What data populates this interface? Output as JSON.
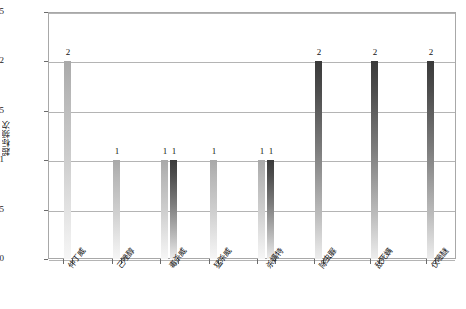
{
  "chart_data": {
    "type": "bar",
    "title": "",
    "xlabel": "",
    "ylabel": "超标频次",
    "ylim": [
      0,
      2.5
    ],
    "ytick_labels": [
      "0",
      "0.5",
      "1",
      "1.5",
      "2",
      "2.5"
    ],
    "ytick_values": [
      0,
      0.5,
      1,
      1.5,
      2,
      2.5
    ],
    "grid": true,
    "legend": "none",
    "categories": [
      "仲丁威",
      "己唑醇",
      "毒杀威",
      "猛杀威",
      "杀螨特",
      "除虫脲",
      "敌死螨",
      "仅嘧醚"
    ],
    "series": [
      {
        "name": "series-a",
        "shade": "light",
        "values": [
          2,
          1,
          1,
          1,
          1,
          2,
          2,
          2
        ]
      },
      {
        "name": "series-b",
        "shade": "dark",
        "values": [
          null,
          null,
          1,
          null,
          1,
          null,
          null,
          null
        ]
      }
    ],
    "bars": [
      {
        "id": "bar-1",
        "category": "仲丁威",
        "value": 2,
        "label": "2",
        "shade": "light",
        "x": 64,
        "label_x": 57
      },
      {
        "id": "bar-2",
        "category": "己唑醇",
        "value": 1,
        "label": "1",
        "shade": "light",
        "x": 113,
        "label_x": 106
      },
      {
        "id": "bar-3",
        "category": "毒杀威",
        "value": 1,
        "label": "1",
        "shade": "light",
        "x": 161,
        "label_x": 154
      },
      {
        "id": "bar-4",
        "category": "毒杀威",
        "value": 1,
        "label": "1",
        "shade": "dark",
        "x": 170,
        "label_x": 163
      },
      {
        "id": "bar-5",
        "category": "猛杀威",
        "value": 1,
        "label": "1",
        "shade": "light",
        "x": 210,
        "label_x": 203
      },
      {
        "id": "bar-6",
        "category": "杀螨特",
        "value": 1,
        "label": "1",
        "shade": "light",
        "x": 258,
        "label_x": 251
      },
      {
        "id": "bar-7",
        "category": "杀螨特",
        "value": 1,
        "label": "1",
        "shade": "dark",
        "x": 267,
        "label_x": 260
      },
      {
        "id": "bar-8",
        "category": "除虫脲",
        "value": 2,
        "label": "2",
        "shade": "dark",
        "x": 315,
        "label_x": 308
      },
      {
        "id": "bar-9",
        "category": "敌死螨",
        "value": 2,
        "label": "2",
        "shade": "dark",
        "x": 371,
        "label_x": 364
      },
      {
        "id": "bar-10",
        "category": "仅嘧醚",
        "value": 2,
        "label": "2",
        "shade": "dark",
        "x": 427,
        "label_x": 420
      }
    ],
    "colors": {
      "bar_light_top": "#a9a9a9",
      "bar_light_bottom": "#f6f6f6",
      "bar_dark_top": "#3a3a3a",
      "bar_dark_bottom": "#ededed",
      "gridline": "#b4b4b4",
      "axis": "#a8a8a8",
      "text": "#111111",
      "background": "#ffffff"
    }
  }
}
